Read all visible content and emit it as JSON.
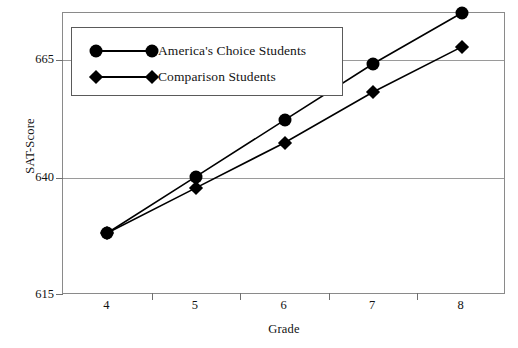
{
  "chart_data": {
    "type": "line",
    "title": "",
    "xlabel": "Grade",
    "ylabel": "SAT-Score",
    "categories": [
      "4",
      "5",
      "6",
      "7",
      "8"
    ],
    "x": [
      4,
      5,
      6,
      7,
      8
    ],
    "xlim": [
      3.5,
      8.5
    ],
    "ylim": [
      615,
      665
    ],
    "yticks": [
      615,
      640,
      665
    ],
    "xticks": [
      "4",
      "5",
      "6",
      "7",
      "8"
    ],
    "grid": true,
    "legend_position": "top-left",
    "series": [
      {
        "name": "America's Choice Students",
        "marker": "circle",
        "color": "#000000",
        "values": [
          626,
          636,
          646,
          656,
          665
        ]
      },
      {
        "name": "Comparison Students",
        "marker": "diamond",
        "color": "#000000",
        "values": [
          626,
          634,
          642,
          651,
          659
        ]
      }
    ]
  },
  "legend": {
    "items": [
      {
        "label": "America's Choice Students",
        "marker": "circle"
      },
      {
        "label": "Comparison Students",
        "marker": "diamond"
      }
    ]
  },
  "axes": {
    "y_title": "SAT-Score",
    "x_title": "Grade",
    "y_tick_labels": [
      "665",
      "640",
      "615"
    ],
    "x_tick_labels": [
      "4",
      "5",
      "6",
      "7",
      "8"
    ]
  },
  "colors": {
    "series": "#000000",
    "grid": "#9a9a9a",
    "frame": "#8a8a8a",
    "background": "#ffffff",
    "text": "#141414"
  }
}
